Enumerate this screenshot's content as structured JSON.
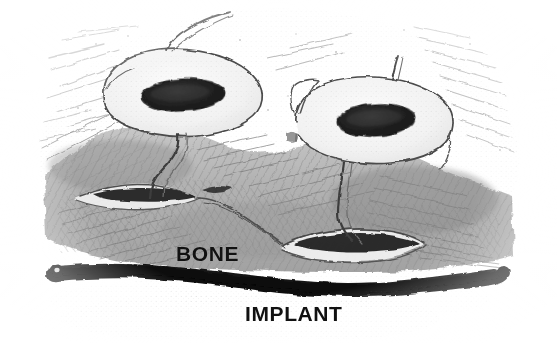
{
  "figure": {
    "kind": "hand-drawn pencil scientific illustration",
    "width": 557,
    "height": 343,
    "background_color": "#ffffff"
  },
  "labels": {
    "bone": "BONE",
    "implant": "IMPLANT"
  },
  "colors": {
    "paper": "#ffffff",
    "pencil_light": "#c9c9c9",
    "pencil_mid": "#9a9a9a",
    "pencil_dark": "#6e6e6e",
    "outline": "#4a4a4a",
    "nucleus": "#1d1d1d",
    "implant_black": "#0c0c0c",
    "text": "#111111"
  },
  "structures": {
    "cells": [
      {
        "name": "left-osteoclast",
        "body_center": [
          182,
          93
        ],
        "body_rx": 84,
        "body_ry": 42,
        "nucleus_center": [
          183,
          95
        ],
        "nucleus_rx": 42,
        "nucleus_ry": 15,
        "nucleus_rotation_deg": -3,
        "apical_process_tip": [
          232,
          12
        ],
        "basal_process_tip": [
          150,
          196
        ]
      },
      {
        "name": "right-osteoclast",
        "body_center": [
          372,
          118
        ],
        "body_rx": 80,
        "body_ry": 40,
        "nucleus_center": [
          376,
          120
        ],
        "nucleus_rx": 38,
        "nucleus_ry": 15,
        "nucleus_rotation_deg": -4,
        "apical_process_tip": [
          398,
          56
        ],
        "basal_process_tip": [
          352,
          238
        ]
      }
    ],
    "lacunae": [
      {
        "name": "left-resorption-lacuna",
        "center": [
          140,
          193
        ],
        "rx": 58,
        "ry": 9
      },
      {
        "name": "right-resorption-lacuna",
        "center": [
          345,
          246
        ],
        "rx": 65,
        "ry": 10
      }
    ],
    "bone_mass": {
      "name": "bone-matrix",
      "top_left": [
        48,
        118
      ],
      "bottom_right": [
        512,
        272
      ],
      "texture": "cross-hatched pencil striations"
    },
    "implant_band": {
      "name": "implant-surface",
      "x_start": 52,
      "x_end": 508,
      "y_center": 272,
      "thickness": 15,
      "shape": "thick wavy black band"
    }
  }
}
